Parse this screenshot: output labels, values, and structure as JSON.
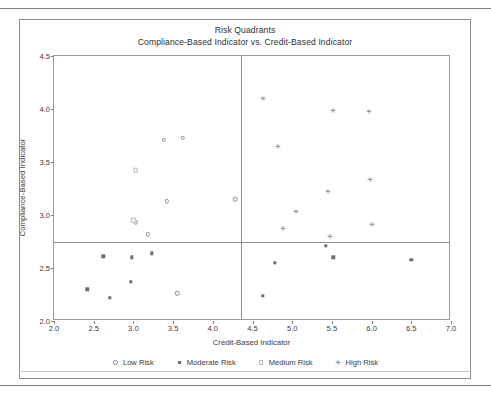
{
  "chart_data": {
    "type": "scatter",
    "title": "Risk Quadrants",
    "subtitle": "Compliance-Based Indicator vs. Credit-Based Indicator",
    "xlabel": "Credit-Based Indicator",
    "ylabel": "Compliance-Based Indicator",
    "xlim": [
      2.0,
      7.0
    ],
    "ylim": [
      2.0,
      4.5
    ],
    "xticks": [
      "2.0",
      "2.5",
      "3.0",
      "3.5",
      "4.0",
      "4.5",
      "5.0",
      "5.5",
      "6.0",
      "6.5",
      "7.0"
    ],
    "yticks": [
      "2.0",
      "2.5",
      "3.0",
      "3.5",
      "4.0",
      "4.5"
    ],
    "grid": false,
    "legend_position": "bottom",
    "reference_lines": {
      "vertical_x": 4.35,
      "horizontal_y": 2.75
    },
    "series": [
      {
        "name": "Low Risk",
        "marker": "open-circle",
        "color": "#8d8d8d",
        "points": [
          {
            "x": 3.03,
            "y": 2.93
          },
          {
            "x": 3.18,
            "y": 2.82
          },
          {
            "x": 3.38,
            "y": 3.71
          },
          {
            "x": 3.42,
            "y": 3.13
          },
          {
            "x": 3.62,
            "y": 3.73
          },
          {
            "x": 3.55,
            "y": 2.26
          },
          {
            "x": 4.28,
            "y": 3.15
          }
        ]
      },
      {
        "name": "Moderate Risk",
        "marker": "filled-square",
        "color": "#6f6f72",
        "points": [
          {
            "x": 2.42,
            "y": 2.3
          },
          {
            "x": 2.62,
            "y": 2.61
          },
          {
            "x": 2.7,
            "y": 2.22
          },
          {
            "x": 2.98,
            "y": 2.6
          },
          {
            "x": 2.97,
            "y": 2.37
          },
          {
            "x": 3.23,
            "y": 2.64
          },
          {
            "x": 4.63,
            "y": 2.24
          },
          {
            "x": 4.78,
            "y": 2.55
          },
          {
            "x": 5.42,
            "y": 2.71
          },
          {
            "x": 5.52,
            "y": 2.6
          },
          {
            "x": 6.5,
            "y": 2.58
          }
        ]
      },
      {
        "name": "Medium Risk",
        "marker": "open-square",
        "color": "#b9b9bd",
        "points": [
          {
            "x": 3.03,
            "y": 3.42
          },
          {
            "x": 3.0,
            "y": 2.95
          }
        ]
      },
      {
        "name": "High Risk",
        "marker": "asterisk",
        "color": "#76767a",
        "points": [
          {
            "x": 4.63,
            "y": 4.09
          },
          {
            "x": 4.82,
            "y": 3.64
          },
          {
            "x": 4.88,
            "y": 2.87
          },
          {
            "x": 5.05,
            "y": 3.03
          },
          {
            "x": 5.45,
            "y": 3.22
          },
          {
            "x": 5.48,
            "y": 2.79
          },
          {
            "x": 5.52,
            "y": 3.98
          },
          {
            "x": 5.97,
            "y": 3.97
          },
          {
            "x": 5.98,
            "y": 3.33
          },
          {
            "x": 6.0,
            "y": 2.91
          }
        ]
      }
    ]
  },
  "legend": {
    "items": [
      {
        "label": "Low Risk",
        "symbol": "open-circle"
      },
      {
        "label": "Moderate Risk",
        "symbol": "filled-square"
      },
      {
        "label": "Medium Risk",
        "symbol": "open-square"
      },
      {
        "label": "High Risk",
        "symbol": "asterisk"
      }
    ]
  }
}
